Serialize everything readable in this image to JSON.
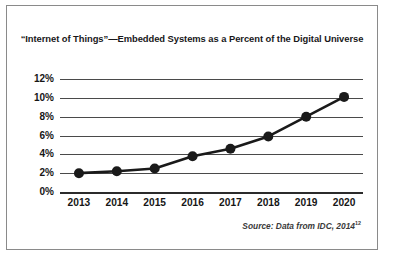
{
  "figure": {
    "title": "“Internet of Things”—Embedded Systems as a Percent of the Digital Universe",
    "source_text": "Source: Data from IDC, 2014",
    "source_superscript": "12",
    "border_color": "#8a8a8a",
    "background_color": "#ffffff",
    "line_color": "#1a1a1a",
    "grid_color": "#4a4a4a"
  },
  "chart_data": {
    "type": "line",
    "title": "“Internet of Things”—Embedded Systems as a Percent of the Digital Universe",
    "xlabel": "",
    "ylabel": "",
    "categories": [
      "2013",
      "2014",
      "2015",
      "2016",
      "2017",
      "2018",
      "2019",
      "2020"
    ],
    "values": [
      2.0,
      2.2,
      2.5,
      3.8,
      4.6,
      5.9,
      8.0,
      10.1
    ],
    "series": [
      {
        "name": "Embedded Systems as a Percent of the Digital Universe",
        "values": [
          2.0,
          2.2,
          2.5,
          3.8,
          4.6,
          5.9,
          8.0,
          10.1
        ]
      }
    ],
    "ylim": [
      0,
      12
    ],
    "ytick_values": [
      12,
      10,
      8,
      6,
      4,
      2,
      0
    ],
    "ytick_labels": [
      "12%",
      "10%",
      "8%",
      "6%",
      "4%",
      "2%",
      "0%"
    ],
    "xtick_labels": [
      "2013",
      "2014",
      "2015",
      "2016",
      "2017",
      "2018",
      "2019",
      "2020"
    ],
    "grid": true,
    "grid_axis": "y",
    "legend": false,
    "marker": "circle",
    "annotations": [
      "Source: Data from IDC, 2014"
    ]
  }
}
